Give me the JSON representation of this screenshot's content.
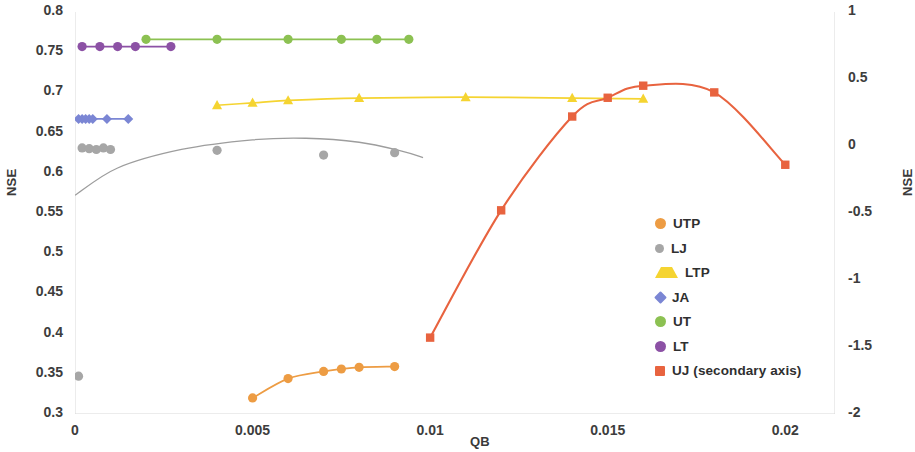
{
  "chart_data": {
    "type": "scatter",
    "title": "",
    "xlabel": "QB",
    "ylabel": "NSE",
    "ylabel_secondary": "NSE",
    "xlim": [
      0,
      0.0214
    ],
    "ylim": [
      0.3,
      0.8
    ],
    "ylim_secondary": [
      -2,
      1
    ],
    "xticks": [
      "0",
      "0.005",
      "0.01",
      "0.015",
      "0.02"
    ],
    "xtick_values": [
      0,
      0.005,
      0.01,
      0.015,
      0.02
    ],
    "yticks": [
      "0.3",
      "0.35",
      "0.4",
      "0.45",
      "0.5",
      "0.55",
      "0.6",
      "0.65",
      "0.7",
      "0.75",
      "0.8"
    ],
    "ytick_values": [
      0.3,
      0.35,
      0.4,
      0.45,
      0.5,
      0.55,
      0.6,
      0.65,
      0.7,
      0.75,
      0.8
    ],
    "yticks_secondary": [
      "-2",
      "-1.5",
      "-1",
      "-0.5",
      "0",
      "0.5",
      "1"
    ],
    "ytick_secondary_values": [
      -2,
      -1.5,
      -1,
      -0.5,
      0,
      0.5,
      1
    ],
    "grid": false,
    "legend_position": "center-right",
    "series": [
      {
        "name": "UTP",
        "color": "#ed9c43",
        "marker": "circle",
        "axis": "primary",
        "line": true,
        "x": [
          0.005,
          0.006,
          0.007,
          0.0075,
          0.008,
          0.009
        ],
        "y": [
          0.32,
          0.344,
          0.353,
          0.356,
          0.358,
          0.359
        ]
      },
      {
        "name": "LJ",
        "color": "#a6a6a6",
        "marker": "circle",
        "axis": "primary",
        "line": false,
        "trendline": true,
        "x": [
          0.0002,
          0.0004,
          0.0006,
          0.0008,
          0.001,
          0.004,
          0.007,
          0.009,
          0.0001
        ],
        "y": [
          0.631,
          0.63,
          0.629,
          0.631,
          0.629,
          0.628,
          0.622,
          0.625,
          0.347
        ]
      },
      {
        "name": "LTP",
        "color": "#f5d431",
        "marker": "triangle",
        "axis": "primary",
        "line": true,
        "x": [
          0.004,
          0.005,
          0.006,
          0.008,
          0.011,
          0.014,
          0.016
        ],
        "y": [
          0.684,
          0.687,
          0.69,
          0.693,
          0.694,
          0.693,
          0.692
        ]
      },
      {
        "name": "JA",
        "color": "#7b86d4",
        "marker": "diamond",
        "axis": "primary",
        "line": true,
        "x": [
          0.0001,
          0.0002,
          0.0003,
          0.0004,
          0.0005,
          0.0009,
          0.0015
        ],
        "y": [
          0.667,
          0.667,
          0.667,
          0.667,
          0.667,
          0.667,
          0.667
        ]
      },
      {
        "name": "UT",
        "color": "#8cc152",
        "marker": "circle",
        "axis": "primary",
        "line": true,
        "x": [
          0.002,
          0.004,
          0.006,
          0.0075,
          0.0085,
          0.0094
        ],
        "y": [
          0.766,
          0.766,
          0.766,
          0.766,
          0.766,
          0.766
        ]
      },
      {
        "name": "LT",
        "color": "#8c51a5",
        "marker": "circle",
        "axis": "primary",
        "line": true,
        "x": [
          0.0002,
          0.0007,
          0.0012,
          0.0017,
          0.0027
        ],
        "y": [
          0.757,
          0.757,
          0.757,
          0.757,
          0.757
        ]
      },
      {
        "name": "UJ (secondary axis)",
        "color": "#e8633f",
        "marker": "square",
        "axis": "secondary",
        "line": true,
        "x": [
          0.01,
          0.012,
          0.014,
          0.015,
          0.016,
          0.018,
          0.02
        ],
        "y": [
          -1.43,
          -0.48,
          0.22,
          0.36,
          0.45,
          0.4,
          -0.14
        ]
      }
    ]
  },
  "axes": {
    "left_title": "NSE",
    "right_title": "NSE",
    "x_title": "QB"
  },
  "legend": {
    "items": [
      {
        "label": "UTP",
        "color": "#ed9c43",
        "marker": "circle"
      },
      {
        "label": "LJ",
        "color": "#a6a6a6",
        "marker": "circle"
      },
      {
        "label": "LTP",
        "color": "#f5d431",
        "marker": "triangle"
      },
      {
        "label": "JA",
        "color": "#7b86d4",
        "marker": "diamond"
      },
      {
        "label": "UT",
        "color": "#8cc152",
        "marker": "circle"
      },
      {
        "label": "LT",
        "color": "#8c51a5",
        "marker": "circle"
      },
      {
        "label": "UJ (secondary axis)",
        "color": "#e8633f",
        "marker": "square"
      }
    ]
  }
}
